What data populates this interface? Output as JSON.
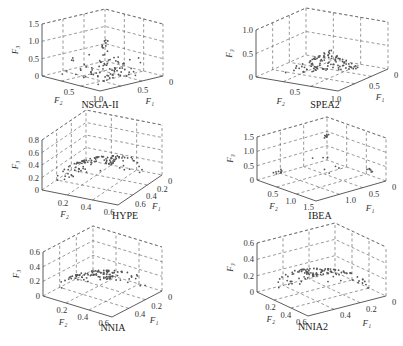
{
  "chart_data": [
    {
      "type": "scatter3d",
      "title": "NSGA-II",
      "xlabel": "F1",
      "ylabel": "F2",
      "zlabel": "F3",
      "zticks": [
        "0",
        "0.5",
        "1.0",
        "1.5"
      ],
      "f1ticks": [
        "0",
        "0.5"
      ],
      "f2ticks": [
        "0.5",
        "1.0"
      ],
      "grid": true,
      "description": "Points concentrated near the base plane, with a small cluster rising near F3 about 0.5-1.0 at the center",
      "box": {
        "lt": [
          42,
          24
        ],
        "tb": [
          100,
          8
        ],
        "rt": [
          163,
          24
        ],
        "lb": [
          42,
          76
        ],
        "fb": [
          100,
          91
        ],
        "rb": [
          163,
          76
        ]
      },
      "shape": "flat",
      "npts": 90,
      "seed": 11
    },
    {
      "type": "scatter3d",
      "title": "SPEA2",
      "xlabel": "F1",
      "ylabel": "F2",
      "zlabel": "F3",
      "zticks": [
        "0",
        "0.5",
        "1.0"
      ],
      "f1ticks": [
        "0",
        "0.5"
      ],
      "f2ticks": [
        "0.5",
        "1.0"
      ],
      "grid": true,
      "description": "Uniform triangular (simplex) Pareto front of points from F3=1 down to base plane",
      "box": {
        "lt": [
          256,
          30
        ],
        "tb": [
          306,
          8
        ],
        "rt": [
          388,
          22
        ],
        "lb": [
          256,
          77
        ],
        "fb": [
          338,
          91
        ],
        "rb": [
          388,
          69
        ]
      },
      "shape": "simplex",
      "npts": 105,
      "seed": 23
    },
    {
      "type": "scatter3d",
      "title": "HYPE",
      "xlabel": "F1",
      "ylabel": "F2",
      "zlabel": "F3",
      "zticks": [
        "0",
        "0.2",
        "0.4",
        "0.6",
        "0.8"
      ],
      "f1ticks": [
        "0",
        "0.2",
        "0.4",
        "0.6"
      ],
      "f2ticks": [
        "0.2",
        "0.4",
        "0.6"
      ],
      "grid": true,
      "description": "Scattered points filling a spherical-like front",
      "box": {
        "lt": [
          42,
          140
        ],
        "tb": [
          82,
          118
        ],
        "rt": [
          162,
          135
        ],
        "lb": [
          42,
          190
        ],
        "fb": [
          118,
          205
        ],
        "rb": [
          162,
          175
        ]
      },
      "shape": "sphere",
      "npts": 110,
      "seed": 37
    },
    {
      "type": "scatter3d",
      "title": "IBEA",
      "xlabel": "F1",
      "ylabel": "F2",
      "zlabel": "F3",
      "zticks": [
        "0",
        "0.5",
        "1.0",
        "1.5"
      ],
      "f1ticks": [
        "0",
        "0.5",
        "1.0"
      ],
      "f2ticks": [
        "0.5",
        "1.0",
        "1.5"
      ],
      "grid": true,
      "description": "Few clustered points at the extremes of the front",
      "box": {
        "lt": [
          257,
          137
        ],
        "tb": [
          327,
          117
        ],
        "rt": [
          386,
          136
        ],
        "lb": [
          257,
          180
        ],
        "fb": [
          316,
          201
        ],
        "rb": [
          386,
          181
        ]
      },
      "shape": "clusters",
      "npts": 30,
      "seed": 41
    },
    {
      "type": "scatter3d",
      "title": "NNIA",
      "xlabel": "F1",
      "ylabel": "F2",
      "zlabel": "F3",
      "zticks": [
        "0",
        "0.2",
        "0.4",
        "0.6"
      ],
      "f1ticks": [
        "0",
        "0.2",
        "0.4"
      ],
      "f2ticks": [
        "0.2",
        "0.4",
        "0.6"
      ],
      "grid": true,
      "description": "Scattered points over front with denser region near the base",
      "box": {
        "lt": [
          43,
          252
        ],
        "tb": [
          92,
          229
        ],
        "rt": [
          162,
          247
        ],
        "lb": [
          43,
          296
        ],
        "fb": [
          112,
          317
        ],
        "rb": [
          162,
          291
        ]
      },
      "shape": "sphere",
      "npts": 100,
      "seed": 53
    },
    {
      "type": "scatter3d",
      "title": "NNIA2",
      "xlabel": "F1",
      "ylabel": "F2",
      "zlabel": "F3",
      "zticks": [
        "0",
        "0.2",
        "0.4",
        "0.6"
      ],
      "f1ticks": [
        "0",
        "0.2",
        "0.4"
      ],
      "f2ticks": [
        "0.2",
        "0.4",
        "0.6"
      ],
      "grid": true,
      "description": "Evenly spread points over spherical front",
      "box": {
        "lt": [
          257,
          243
        ],
        "tb": [
          333,
          229
        ],
        "rt": [
          386,
          249
        ],
        "lb": [
          257,
          292
        ],
        "fb": [
          308,
          316
        ],
        "rb": [
          386,
          296
        ]
      },
      "shape": "sphere",
      "npts": 110,
      "seed": 67
    }
  ]
}
